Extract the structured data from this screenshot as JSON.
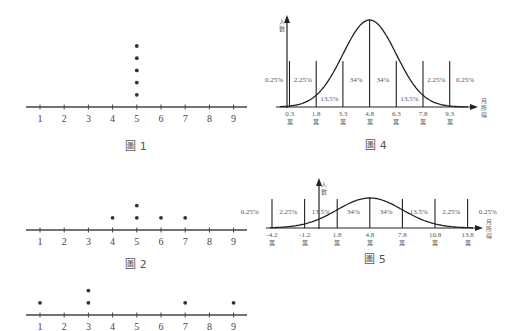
{
  "chart_data": [
    {
      "type": "scatter",
      "title": "圖 1",
      "kind": "dot plot",
      "x_ticks": [
        1,
        2,
        3,
        4,
        5,
        6,
        7,
        8,
        9
      ],
      "points": [
        [
          5,
          1
        ],
        [
          5,
          2
        ],
        [
          5,
          3
        ],
        [
          5,
          4
        ],
        [
          5,
          5
        ]
      ]
    },
    {
      "type": "scatter",
      "title": "圖 2",
      "kind": "dot plot",
      "x_ticks": [
        1,
        2,
        3,
        4,
        5,
        6,
        7,
        8,
        9
      ],
      "points": [
        [
          4,
          1
        ],
        [
          5,
          1
        ],
        [
          5,
          2
        ],
        [
          6,
          1
        ],
        [
          7,
          1
        ]
      ]
    },
    {
      "type": "scatter",
      "title": "",
      "kind": "dot plot",
      "x_ticks": [
        1,
        2,
        3,
        4,
        5,
        6,
        7,
        8,
        9
      ],
      "points": [
        [
          1,
          1
        ],
        [
          3,
          1
        ],
        [
          3,
          2
        ],
        [
          7,
          1
        ],
        [
          9,
          1
        ]
      ]
    },
    {
      "type": "line",
      "title": "圖 4",
      "kind": "normal distribution",
      "xlabel": "月所得",
      "ylabel": "人數",
      "mean": 4.8,
      "sd": 1.5,
      "x_ticks": [
        "0.3",
        "1.8",
        "3.3",
        "4.8",
        "6.3",
        "7.8",
        "9.3"
      ],
      "tick_unit": "萬",
      "region_percents": [
        "0.25%",
        "2.25%",
        "13.5%",
        "34%",
        "34%",
        "13.5%",
        "2.25%",
        "0.25%"
      ]
    },
    {
      "type": "line",
      "title": "圖 5",
      "kind": "normal distribution",
      "xlabel": "月所得",
      "ylabel": "人數",
      "mean": 4.8,
      "sd": 3,
      "x_ticks": [
        "-4.2",
        "-1.2",
        "1.8",
        "4.8",
        "7.8",
        "10.8",
        "13.8"
      ],
      "tick_unit": "萬",
      "region_percents": [
        "0.25%",
        "2.25%",
        "13.5%",
        "34%",
        "34%",
        "13.5%",
        "2.25%",
        "0.25%"
      ]
    }
  ],
  "captions": {
    "fig1": "圖 1",
    "fig2": "圖 2",
    "fig4": "圖 4",
    "fig5": "圖 5"
  },
  "labels": {
    "y_axis": [
      "人",
      "數"
    ],
    "x_axis": [
      "月",
      "所",
      "得"
    ],
    "unit": "萬"
  }
}
